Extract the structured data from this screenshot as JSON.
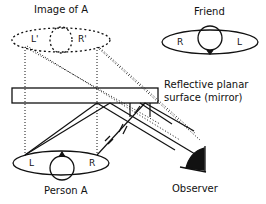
{
  "labels": {
    "image_of_a": "Image of A",
    "friend": "Friend",
    "mirror_line1": "Reflective planar",
    "mirror_line2": "surface (mirror)",
    "person_a": "Person A",
    "observer": "Observer",
    "image_left": "L'",
    "image_right": "R'",
    "friend_left": "R",
    "friend_right": "L",
    "person_left": "L",
    "person_right": "R"
  },
  "colors": {
    "stroke": "#111111",
    "background": "#ffffff"
  }
}
